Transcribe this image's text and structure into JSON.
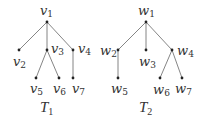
{
  "trees": [
    {
      "title": {
        "base": "T",
        "sub": "1"
      },
      "nodes": [
        {
          "id": "v1",
          "base": "v",
          "sub": "1",
          "x": 47,
          "y": 22
        },
        {
          "id": "v2",
          "base": "v",
          "sub": "2",
          "x": 19,
          "y": 50
        },
        {
          "id": "v3",
          "base": "v",
          "sub": "3",
          "x": 47,
          "y": 50
        },
        {
          "id": "v4",
          "base": "v",
          "sub": "4",
          "x": 73,
          "y": 50
        },
        {
          "id": "v5",
          "base": "v",
          "sub": "5",
          "x": 36,
          "y": 78
        },
        {
          "id": "v6",
          "base": "v",
          "sub": "6",
          "x": 59,
          "y": 78
        },
        {
          "id": "v7",
          "base": "v",
          "sub": "7",
          "x": 73,
          "y": 78
        }
      ],
      "edges": [
        [
          "v1",
          "v2"
        ],
        [
          "v1",
          "v3"
        ],
        [
          "v1",
          "v4"
        ],
        [
          "v3",
          "v5"
        ],
        [
          "v3",
          "v6"
        ],
        [
          "v4",
          "v7"
        ]
      ]
    },
    {
      "title": {
        "base": "T",
        "sub": "2"
      },
      "nodes": [
        {
          "id": "w1",
          "base": "w",
          "sub": "1",
          "x": 146,
          "y": 22
        },
        {
          "id": "w2",
          "base": "w",
          "sub": "2",
          "x": 118,
          "y": 50
        },
        {
          "id": "w3",
          "base": "w",
          "sub": "3",
          "x": 146,
          "y": 50
        },
        {
          "id": "w4",
          "base": "w",
          "sub": "4",
          "x": 172,
          "y": 50
        },
        {
          "id": "w5",
          "base": "w",
          "sub": "5",
          "x": 118,
          "y": 78
        },
        {
          "id": "w6",
          "base": "w",
          "sub": "6",
          "x": 160,
          "y": 78
        },
        {
          "id": "w7",
          "base": "w",
          "sub": "7",
          "x": 182,
          "y": 78
        }
      ],
      "edges": [
        [
          "w1",
          "w2"
        ],
        [
          "w1",
          "w3"
        ],
        [
          "w1",
          "w4"
        ],
        [
          "w2",
          "w5"
        ],
        [
          "w4",
          "w6"
        ],
        [
          "w4",
          "w7"
        ]
      ]
    }
  ],
  "colors": {
    "edge": "#777777",
    "node": "#222222",
    "text": "#333333"
  }
}
